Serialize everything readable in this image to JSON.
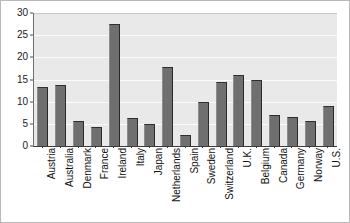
{
  "chart_data": {
    "type": "bar",
    "title": "",
    "subtitle": "",
    "xlabel": "",
    "ylabel": "",
    "legend": [],
    "legend_position": "none",
    "grid": true,
    "ylim": [
      0,
      30
    ],
    "yticks": [
      0,
      5,
      10,
      15,
      20,
      25,
      30
    ],
    "ytick_labels": [
      "0",
      "5",
      "10",
      "15",
      "20",
      "25",
      "30"
    ],
    "categories": [
      "Austria",
      "Australia",
      "Denmark",
      "France",
      "Ireland",
      "Italy",
      "Japan",
      "Netherlands",
      "Spain",
      "Sweden",
      "Switzerland",
      "U.K.",
      "Belgium",
      "Canada",
      "Germany",
      "Norway",
      "U.S."
    ],
    "values": [
      13.2,
      13.7,
      5.7,
      4.2,
      27.6,
      6.3,
      5.0,
      17.8,
      2.5,
      10.0,
      14.5,
      16.1,
      15.0,
      7.0,
      6.6,
      5.6,
      9.1
    ],
    "bar_color": "#6f6f6f",
    "plot_background_color": "#e9e9e9",
    "gridline_color": "#fbfbfb",
    "axis_color": "#3c3c3c",
    "text_color": "#111111"
  }
}
